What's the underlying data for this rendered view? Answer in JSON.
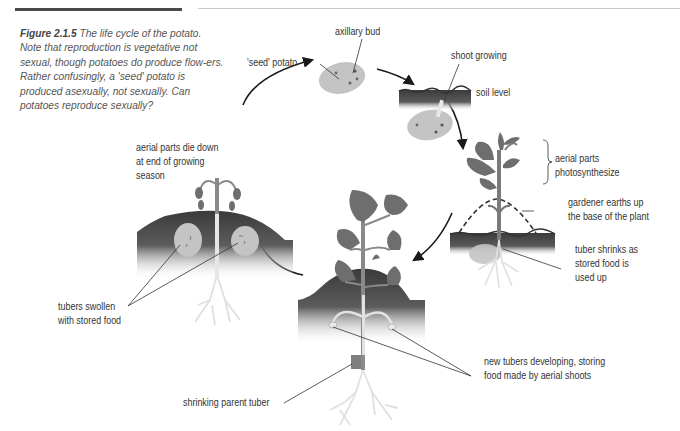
{
  "header": {
    "partial_running_head": "",
    "rule_left_color": "#4a4a4a",
    "rule_right_color": "#c8c8c8"
  },
  "caption": {
    "figure_number": "Figure 2.1.5",
    "text": " The life cycle of the potato. Note that reproduction is vegetative not sexual, though potatoes do produce flow-ers. Rather confusingly, a 'seed' potato is produced asexually, not sexually. Can potatoes reproduce sexually?"
  },
  "labels": {
    "axillary_bud": "axillary bud",
    "seed_potato": "'seed' potato",
    "shoot_growing": "shoot growing",
    "soil_level": "soil level",
    "aerial_parts_photosynthesize_1": "aerial parts",
    "aerial_parts_photosynthesize_2": "photosynthesize",
    "gardener_earths_up_1": "gardener earths up",
    "gardener_earths_up_2": "the base of the plant",
    "tuber_shrinks_1": "tuber shrinks as",
    "tuber_shrinks_2": "stored food is",
    "tuber_shrinks_3": "used up",
    "aerial_parts_die_1": "aerial parts die down",
    "aerial_parts_die_2": "at end of growing",
    "aerial_parts_die_3": "season",
    "tubers_swollen_1": "tubers swollen",
    "tubers_swollen_2": "with stored food",
    "new_tubers_1": "new tubers developing, storing",
    "new_tubers_2": "food made by aerial shoots",
    "shrinking_parent": "shrinking parent tuber"
  },
  "colors": {
    "soil_dark": "#3e3e3e",
    "tuber": "#c4c4c4",
    "leaf": "#6e6e6e",
    "root": "#e2e2e2",
    "text": "#333333",
    "arrow": "#1a1a1a"
  },
  "cycle_stages": [
    "'seed' potato with axillary buds",
    "shoot growing below soil level",
    "aerial parts photosynthesize; gardener earths up",
    "new tubers developing; parent tuber shrinks",
    "aerial parts die down; tubers swollen with stored food"
  ]
}
